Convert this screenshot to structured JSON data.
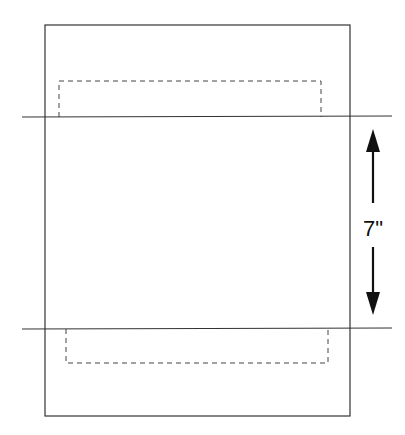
{
  "diagram": {
    "title": "",
    "width": 405,
    "height": 435,
    "colors": {
      "background": "#ffffff",
      "line": "#333333",
      "dashed": "#444444",
      "arrow": "#111111",
      "text": "#111111"
    },
    "page_outline": {
      "x": 45,
      "y": 25,
      "width": 305,
      "height": 391
    },
    "fold_lines": [
      {
        "name": "top-fold-line",
        "x1": 22,
        "y1": 117,
        "x2": 392,
        "y2": 116
      },
      {
        "name": "bottom-fold-line",
        "x1": 22,
        "y1": 329,
        "x2": 392,
        "y2": 328
      }
    ],
    "dashed_regions": [
      {
        "name": "top-dashed-region",
        "x": 59,
        "y": 81,
        "width": 262,
        "height": 36,
        "open_side": "bottom"
      },
      {
        "name": "bottom-dashed-region",
        "x": 66,
        "y": 329,
        "width": 262,
        "height": 34,
        "open_side": "top"
      }
    ],
    "dimension": {
      "label": "7\"",
      "x": 373,
      "arrow_up": {
        "tip_y": 129,
        "tail_y": 203
      },
      "arrow_down": {
        "tip_y": 315,
        "tail_y": 247
      },
      "label_y": 236
    }
  }
}
